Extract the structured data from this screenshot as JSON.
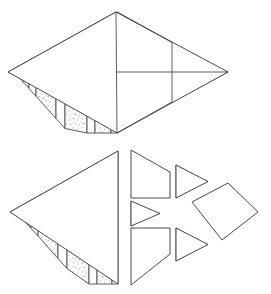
{
  "document": {
    "kind": "geometric-dissection-diagram",
    "title": "",
    "caption": "",
    "figure_count": 2,
    "background_color": "#ffffff",
    "line_color": "#4a4a4a",
    "fill_color": "#ffffff",
    "stipple_color": "#8f8f8f"
  },
  "figures": [
    {
      "id": "assembled-rhombus",
      "label": "",
      "description": "assembled rhombus dissected into vertical strips and triangles",
      "bounds": {
        "x": 8,
        "y": 12,
        "width": 220,
        "height": 121
      },
      "vertices": {
        "left": {
          "x": 8,
          "y": 72
        },
        "top": {
          "x": 116,
          "y": 12
        },
        "right": {
          "x": 228,
          "y": 72
        },
        "bottom": {
          "x": 117,
          "y": 133
        }
      },
      "pieces": [
        {
          "name": "left-big-triangle",
          "fill": "striped",
          "stripe_count": 9
        },
        {
          "name": "upper-right-parallelogram",
          "fill": "plain"
        },
        {
          "name": "upper-right-triangle",
          "fill": "striped",
          "stripe_count": 5
        },
        {
          "name": "lower-right-parallelogram",
          "fill": "plain"
        },
        {
          "name": "lower-right-triangle",
          "fill": "striped",
          "stripe_count": 5
        },
        {
          "name": "far-right-rhombus",
          "fill": "plain"
        }
      ]
    },
    {
      "id": "exploded-rhombus",
      "label": "",
      "description": "same rhombus shown exploded with pieces separated",
      "bounds": {
        "x": 10,
        "y": 150,
        "width": 248,
        "height": 135
      },
      "vertices": {
        "left": {
          "x": 10,
          "y": 212
        },
        "top": {
          "x": 118,
          "y": 151
        },
        "right": {
          "x": 258,
          "y": 212
        },
        "bottom": {
          "x": 118,
          "y": 284
        }
      },
      "pieces": [
        {
          "name": "left-big-triangle",
          "fill": "striped",
          "stripe_count": 9
        },
        {
          "name": "upper-left-parallelogram",
          "fill": "plain"
        },
        {
          "name": "lower-left-parallelogram",
          "fill": "plain"
        },
        {
          "name": "center-small-triangle",
          "fill": "striped",
          "stripe_count": 4
        },
        {
          "name": "upper-right-triangle",
          "fill": "striped",
          "stripe_count": 4
        },
        {
          "name": "lower-right-triangle",
          "fill": "striped",
          "stripe_count": 4
        },
        {
          "name": "right-rhombus",
          "fill": "plain"
        }
      ]
    }
  ]
}
